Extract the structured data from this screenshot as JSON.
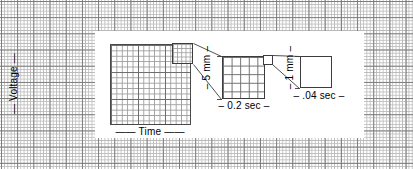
{
  "figure": {
    "background": {
      "name": "ecg-graph-paper",
      "minor_cell_px": 3.24,
      "major_cell_px": 16.2,
      "minor_color": "#b9b9b9",
      "major_color": "#7b7b7b",
      "paper_color": "#ffffff"
    },
    "panels": {
      "left": {
        "name": "full-grid-panel",
        "description": "Full ECG grid sheet",
        "minor_cell_px": 5.4,
        "major_cell_px": 27,
        "border_color": "#4a4a4a"
      },
      "middle": {
        "name": "large-box-panel",
        "description": "One large box magnified, 5 x 5 small boxes",
        "rows": 5,
        "cols": 5,
        "border_color": "#3c3c3c"
      },
      "right": {
        "name": "small-box-panel",
        "description": "One small box magnified",
        "rows": 1,
        "cols": 1,
        "border_color": "#3c3c3c"
      }
    },
    "labels": {
      "voltage_axis": "— Voltage —",
      "time_axis": "—— Time ——",
      "large_box_height": "– 5 mm –",
      "large_box_width": "– 0.2 sec –",
      "small_box_height": "– 1 mm –",
      "small_box_width": "– .04 sec –"
    },
    "leader_lines": {
      "name": "callout-leader-lines",
      "color": "#3c3c3c",
      "from_left_to_middle": "small 5x5 region on full grid expands to middle panel",
      "from_middle_to_right": "single cell on middle panel expands to right square"
    }
  }
}
